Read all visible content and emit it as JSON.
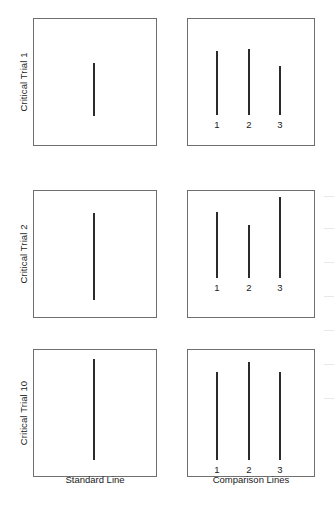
{
  "figure": {
    "type": "stimulus-diagram",
    "background_color": "#ffffff",
    "line_color": "#2b2b2b",
    "box_border_color": "#6f6f6f",
    "column_captions": {
      "standard": "Standard Line",
      "comparison": "Comparison Lines"
    },
    "comparison_labels": [
      "1",
      "2",
      "3"
    ],
    "rows": [
      {
        "label": "Critical Trial 1",
        "top": 18,
        "panel_height": 128,
        "standard": {
          "x": 93,
          "top": 44,
          "length": 53
        },
        "comparison": [
          {
            "label": "1",
            "x": 216,
            "top": 32,
            "length": 64
          },
          {
            "label": "2",
            "x": 248,
            "top": 30,
            "length": 66
          },
          {
            "label": "3",
            "x": 279,
            "top": 47,
            "length": 49
          }
        ],
        "label_y": 100
      },
      {
        "label": "Critical Trial 2",
        "top": 190,
        "panel_height": 128,
        "standard": {
          "x": 93,
          "top": 22,
          "length": 87
        },
        "comparison": [
          {
            "label": "1",
            "x": 216,
            "top": 21,
            "length": 66
          },
          {
            "label": "2",
            "x": 248,
            "top": 34,
            "length": 53
          },
          {
            "label": "3",
            "x": 279,
            "top": 6,
            "length": 81
          }
        ],
        "label_y": 91
      },
      {
        "label": "Critical Trial 10",
        "top": 349,
        "panel_height": 128,
        "standard": {
          "x": 93,
          "top": 9,
          "length": 101
        },
        "comparison": [
          {
            "label": "1",
            "x": 216,
            "top": 22,
            "length": 88
          },
          {
            "label": "2",
            "x": 248,
            "top": 12,
            "length": 98
          },
          {
            "label": "3",
            "x": 279,
            "top": 22,
            "length": 88
          }
        ],
        "label_y": 114
      }
    ],
    "caption_y": 474
  },
  "chart_data": {
    "type": "diagram",
    "title": "",
    "xlabel": "",
    "ylabel": "",
    "categories": [
      "Critical Trial 1",
      "Critical Trial 2",
      "Critical Trial 10"
    ],
    "series": [
      {
        "name": "Standard Line",
        "values": [
          53,
          87,
          101
        ]
      },
      {
        "name": "Comparison Line 1",
        "values": [
          64,
          66,
          88
        ]
      },
      {
        "name": "Comparison Line 2",
        "values": [
          66,
          53,
          98
        ]
      },
      {
        "name": "Comparison Line 3",
        "values": [
          49,
          81,
          88
        ]
      }
    ],
    "units": "pixels (relative line length)",
    "legend_position": "none",
    "grid": false
  }
}
